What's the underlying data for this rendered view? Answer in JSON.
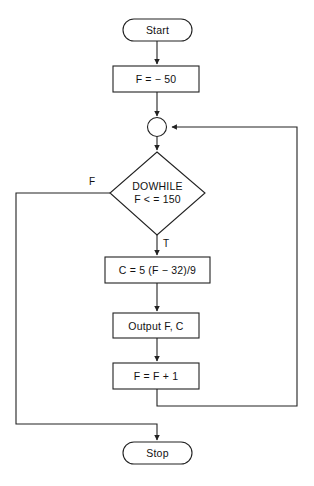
{
  "diagram": {
    "type": "flowchart",
    "nodes": [
      {
        "id": "start",
        "shape": "terminator",
        "label": "Start"
      },
      {
        "id": "init",
        "shape": "process",
        "label": "F = − 50"
      },
      {
        "id": "junction",
        "shape": "connector",
        "label": ""
      },
      {
        "id": "decision",
        "shape": "decision",
        "label_line1": "DOWHILE",
        "label_line2": "F < = 150"
      },
      {
        "id": "convert",
        "shape": "process",
        "label": "C = 5 (F − 32)/9"
      },
      {
        "id": "output",
        "shape": "process",
        "label": "Output F, C"
      },
      {
        "id": "increment",
        "shape": "process",
        "label": "F = F + 1"
      },
      {
        "id": "stop",
        "shape": "terminator",
        "label": "Stop"
      }
    ],
    "edge_labels": {
      "false_branch": "F",
      "true_branch": "T"
    },
    "colors": {
      "stroke": "#222222",
      "fill": "#ffffff",
      "text": "#111111"
    }
  }
}
